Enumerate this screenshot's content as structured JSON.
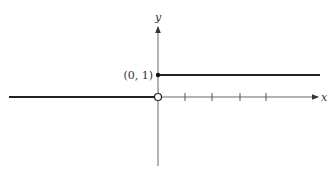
{
  "figure": {
    "axes": {
      "x_label": "x",
      "y_label": "y",
      "origin_px": [
        158,
        97
      ],
      "unit_px": 22,
      "x_ticks_px": [
        185,
        212,
        240,
        266
      ]
    },
    "point_label": "(0, 1)",
    "colors": {
      "axis": "#555555",
      "curve": "#222222",
      "text": "#333333",
      "background": "#ffffff"
    },
    "segments": [
      {
        "name": "lower-branch",
        "from": [
          "-inf",
          0
        ],
        "to": [
          0,
          0
        ],
        "endpoint_at_origin": "open"
      },
      {
        "name": "upper-branch",
        "from": [
          0,
          1
        ],
        "to": [
          "+inf",
          1
        ],
        "endpoint_at_start": "closed"
      }
    ]
  }
}
